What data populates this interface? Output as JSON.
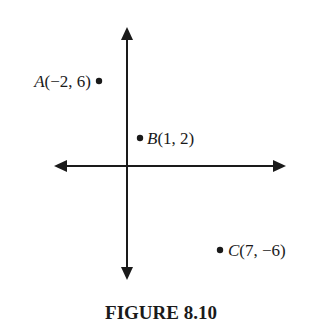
{
  "figure": {
    "caption": "FIGURE 8.10",
    "axes": {
      "x_axis": "horizontal number line with arrows both ends",
      "y_axis": "vertical number line with arrows both ends"
    },
    "points": [
      {
        "name": "A",
        "coords": "(−2, 6)",
        "x": -2,
        "y": 6,
        "label_side": "left"
      },
      {
        "name": "B",
        "coords": "(1, 2)",
        "x": 1,
        "y": 2,
        "label_side": "right"
      },
      {
        "name": "C",
        "coords": "(7, −6)",
        "x": 7,
        "y": -6,
        "label_side": "right"
      }
    ],
    "colors": {
      "ink": "#1a1a1a",
      "background": "#ffffff"
    }
  }
}
